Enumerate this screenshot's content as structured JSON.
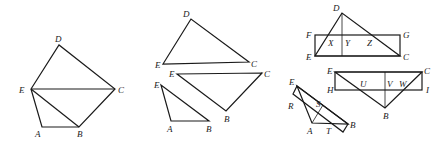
{
  "figures": [
    {
      "id": "pentagon",
      "labels": {
        "D": "D",
        "E": "E",
        "C": "C",
        "A": "A",
        "B": "B"
      }
    },
    {
      "id": "decomposed-triangles",
      "labels": {
        "t1_D": "D",
        "t1_E": "E",
        "t1_C": "C",
        "t2_E": "E",
        "t2_C": "C",
        "t2_B": "B",
        "t3_E": "E",
        "t3_A": "A",
        "t3_B": "B"
      }
    },
    {
      "id": "triangle-rectangle-constructions",
      "labels": {
        "top_D": "D",
        "top_F": "F",
        "top_G": "G",
        "top_E": "E",
        "top_C": "C",
        "top_X": "X",
        "top_Y": "Y",
        "top_Z": "Z",
        "mid_E": "E",
        "mid_C": "C",
        "mid_H": "H",
        "mid_I": "I",
        "mid_B": "B",
        "mid_U": "U",
        "mid_V": "V",
        "mid_W": "W",
        "low_E": "E",
        "low_R": "R",
        "low_S": "S",
        "low_A": "A",
        "low_T": "T",
        "low_B": "B"
      }
    }
  ]
}
